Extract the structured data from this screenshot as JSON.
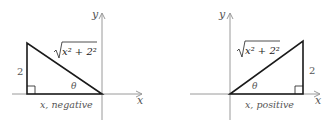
{
  "left_diagram": {
    "axis_x_label": "x",
    "axis_y_label": "y",
    "hypotenuse_label": "x² + 2²",
    "side_label": "2",
    "angle_label": "θ",
    "base_label": "x, negative"
  },
  "right_diagram": {
    "axis_x_label": "x",
    "axis_y_label": "y",
    "hypotenuse_label": "x² + 2²",
    "side_label": "2",
    "angle_label": "θ",
    "base_label": "x, positive"
  },
  "colors": {
    "axis": "#9a9a9a",
    "triangle": "#1a1a1a",
    "label": "#555555"
  }
}
